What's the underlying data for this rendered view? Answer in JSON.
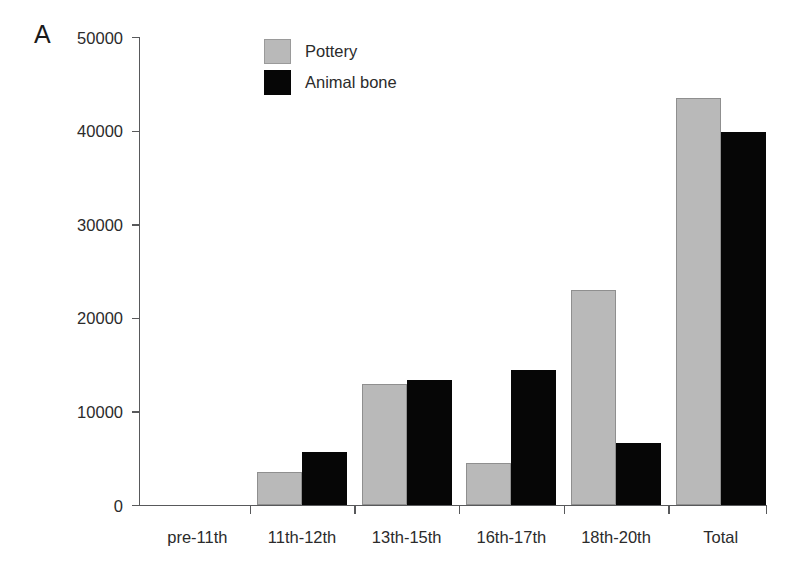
{
  "panel": {
    "label": "A"
  },
  "chart_data": {
    "type": "bar",
    "title": "",
    "xlabel": "",
    "ylabel": "",
    "ylim": [
      0,
      50000
    ],
    "yticks": [
      0,
      10000,
      20000,
      30000,
      40000,
      50000
    ],
    "ytick_labels": [
      "0",
      "10000",
      "20000",
      "30000",
      "40000",
      "50000"
    ],
    "grid": false,
    "legend_position": "top-left-inside",
    "categories": [
      "pre-11th",
      "11th-12th",
      "13th-15th",
      "16th-17th",
      "18th-20th",
      "Total"
    ],
    "series": [
      {
        "name": "Pottery",
        "color": "#b9b9b9",
        "values": [
          0,
          3500,
          12900,
          4450,
          22950,
          43500
        ]
      },
      {
        "name": "Animal bone",
        "color": "#060606",
        "values": [
          0,
          5650,
          13400,
          14400,
          6600,
          39800
        ]
      }
    ]
  }
}
